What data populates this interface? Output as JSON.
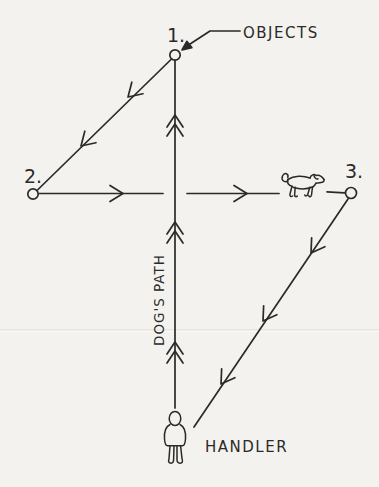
{
  "colors": {
    "ink": "#2a2a2a",
    "paper": "#f4f2ee"
  },
  "labels": {
    "point1": "1.",
    "point2": "2.",
    "point3": "3.",
    "objects": "OBJECTS",
    "dogs_path": "DOG'S PATH",
    "handler": "HANDLER"
  },
  "diagram": {
    "type": "hand-drawn dog training pattern sketch",
    "points": [
      {
        "id": "1",
        "label": "1.",
        "position": "top-center",
        "marker": "small open circle"
      },
      {
        "id": "2",
        "label": "2.",
        "position": "left",
        "marker": "small open circle"
      },
      {
        "id": "3",
        "label": "3.",
        "position": "right",
        "marker": "small open circle"
      }
    ],
    "callout": {
      "text": "OBJECTS",
      "points_to": "point 1 circle",
      "arrowhead": "solid filled"
    },
    "legs": [
      {
        "from": "handler",
        "to": "point-1",
        "label": "DOG'S PATH",
        "direction": "up",
        "arrow_marks": 3,
        "arrow_style": "double chevron"
      },
      {
        "from": "point-1",
        "to": "point-2",
        "direction": "down-left",
        "arrow_marks": 2,
        "arrow_style": "single chevron"
      },
      {
        "from": "point-2",
        "to": "dog",
        "direction": "right",
        "arrow_marks": 2,
        "arrow_style": "single chevron"
      },
      {
        "from": "point-3",
        "to": "handler",
        "direction": "down-left",
        "arrow_marks": 3,
        "arrow_style": "single chevron"
      }
    ],
    "figures": [
      {
        "name": "dog-icon",
        "meaning": "sketched dog walking right, between the path line and point 3"
      },
      {
        "name": "handler-figure-icon",
        "meaning": "sketched person seen from behind, standing at bottom of vertical path"
      }
    ],
    "artifacts": [
      {
        "name": "paper-crease-line",
        "meaning": "faint horizontal scan crease across page"
      }
    ]
  }
}
